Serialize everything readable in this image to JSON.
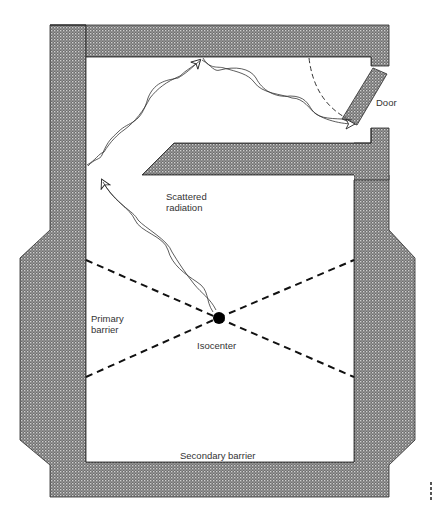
{
  "diagram": {
    "type": "radiotherapy-bunker-floor-plan",
    "labels": {
      "door": "Door",
      "scattered_radiation_line1": "Scattered",
      "scattered_radiation_line2": "radiation",
      "primary_barrier_line1": "Primary",
      "primary_barrier_line2": "barrier",
      "isocenter": "Isocenter",
      "secondary_barrier": "Secondary barrier"
    },
    "elements": [
      {
        "name": "outer-shielding-wall",
        "kind": "hatched-wall"
      },
      {
        "name": "maze-wall",
        "kind": "hatched-wall"
      },
      {
        "name": "door",
        "kind": "hatched-wall",
        "state": "open"
      },
      {
        "name": "door-swing-arc",
        "kind": "dashed-arc"
      },
      {
        "name": "primary-beam-lines",
        "kind": "dashed-lines",
        "count": 4
      },
      {
        "name": "isocenter-point",
        "kind": "filled-circle"
      },
      {
        "name": "scatter-path",
        "kind": "wavy-arrows",
        "segments": 3
      }
    ],
    "colors": {
      "wall_fill": "#7a7a7a",
      "wall_hatch": "#c8c8c8",
      "wall_edge": "#2a2a2a",
      "line": "#111111",
      "background": "#ffffff"
    }
  }
}
